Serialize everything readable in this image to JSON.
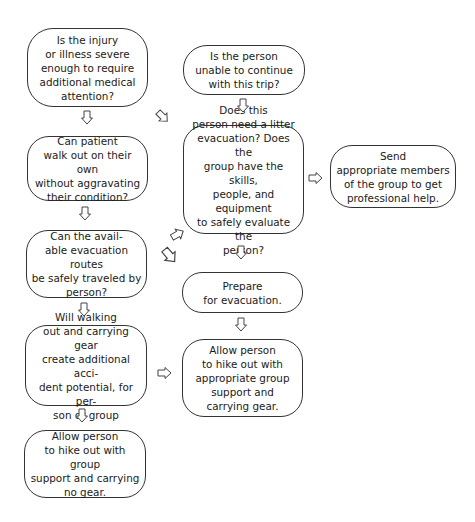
{
  "diagram": {
    "type": "flowchart",
    "nodes": [
      {
        "id": "injury-severe",
        "text": "Is the injury\nor illness severe\nenough to require\nadditional medical\nattention?"
      },
      {
        "id": "unable-continue",
        "text": "Is the person\nunable to continue\nwith this trip?"
      },
      {
        "id": "walk-out",
        "text": "Can patient\nwalk out on their own\nwithout aggravating\ntheir condition?"
      },
      {
        "id": "litter-evacuation",
        "text": "Does this\nperson need a litter\nevacuation? Does the\ngroup have the skills,\npeople, and equipment\nto safely evaluate the\nperson?"
      },
      {
        "id": "send-members",
        "text": "Send\nappropriate members\nof the group to get\nprofessional help."
      },
      {
        "id": "routes-safe",
        "text": "Can the avail-\nable evacuation routes\nbe safely traveled by\nperson?"
      },
      {
        "id": "prepare-evacuation",
        "text": "Prepare\nfor evacuation."
      },
      {
        "id": "accident-potential",
        "text": "Will walking\nout and carrying gear\ncreate additional acci-\ndent potential, for per-\nson or group"
      },
      {
        "id": "hike-with-gear",
        "text": "Allow person\nto hike out with\nappropriate group\nsupport and\ncarrying gear."
      },
      {
        "id": "hike-no-gear",
        "text": "Allow person\nto hike out with group\nsupport and carrying\nno gear."
      }
    ],
    "edges": [
      {
        "from": "injury-severe",
        "to": "walk-out"
      },
      {
        "from": "injury-severe",
        "to": "litter-evacuation"
      },
      {
        "from": "unable-continue",
        "to": "litter-evacuation"
      },
      {
        "from": "walk-out",
        "to": "routes-safe"
      },
      {
        "from": "litter-evacuation",
        "to": "send-members"
      },
      {
        "from": "litter-evacuation",
        "to": "prepare-evacuation"
      },
      {
        "from": "routes-safe",
        "to": "litter-evacuation"
      },
      {
        "from": "routes-safe",
        "to": "prepare-evacuation"
      },
      {
        "from": "routes-safe",
        "to": "accident-potential"
      },
      {
        "from": "prepare-evacuation",
        "to": "hike-with-gear"
      },
      {
        "from": "accident-potential",
        "to": "hike-with-gear"
      },
      {
        "from": "accident-potential",
        "to": "hike-no-gear"
      }
    ]
  }
}
